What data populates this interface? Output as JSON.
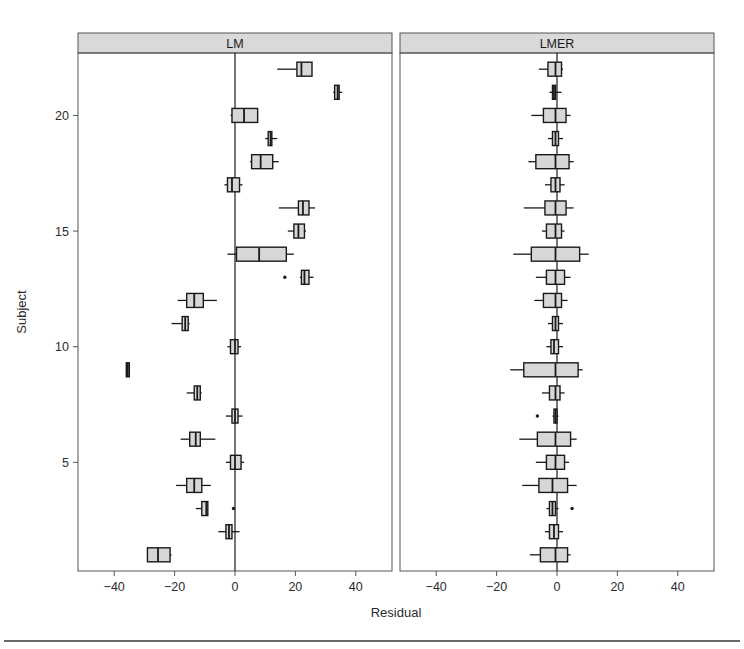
{
  "figure": {
    "background": "#ffffff",
    "frame_color": "#555555",
    "strip_fill": "#d9d9d9",
    "box_fill": "#d7d7d7",
    "line_color": "#1a1a1a",
    "footer_rule_color": "#3a3a3a"
  },
  "chart_data": {
    "type": "box",
    "title": "",
    "xlabel": "Residual",
    "ylabel": "Subject",
    "xlim": [
      -52,
      52
    ],
    "ylim": [
      0.3,
      22.7
    ],
    "xticks": [
      -40,
      -20,
      0,
      20,
      40
    ],
    "xtick_labels": [
      "-40",
      "-20",
      "0",
      "20",
      "40"
    ],
    "yticks": [
      5,
      10,
      15,
      20
    ],
    "ytick_labels": [
      "5",
      "10",
      "15",
      "20"
    ],
    "grid": false,
    "legend": "none",
    "reference_line_x": 0,
    "panels": [
      {
        "name": "LM",
        "label": "LM",
        "boxes": [
          {
            "subject": 22,
            "lower_whisker": 14.0,
            "q1": 20.5,
            "median": 22.0,
            "q3": 25.5,
            "upper_whisker": 25.5,
            "outliers": []
          },
          {
            "subject": 21,
            "lower_whisker": 32.5,
            "q1": 33.0,
            "median": 34.0,
            "q3": 34.5,
            "upper_whisker": 35.5,
            "outliers": []
          },
          {
            "subject": 20,
            "lower_whisker": -1.5,
            "q1": -1.0,
            "median": 3.0,
            "q3": 7.5,
            "upper_whisker": 7.5,
            "outliers": []
          },
          {
            "subject": 19,
            "lower_whisker": 10.0,
            "q1": 11.0,
            "median": 11.8,
            "q3": 12.2,
            "upper_whisker": 14.0,
            "outliers": []
          },
          {
            "subject": 18,
            "lower_whisker": 5.0,
            "q1": 5.5,
            "median": 8.5,
            "q3": 12.5,
            "upper_whisker": 14.5,
            "outliers": []
          },
          {
            "subject": 17,
            "lower_whisker": -3.5,
            "q1": -2.5,
            "median": -1.0,
            "q3": 1.5,
            "upper_whisker": 2.5,
            "outliers": []
          },
          {
            "subject": 16,
            "lower_whisker": 14.5,
            "q1": 21.0,
            "median": 22.5,
            "q3": 24.5,
            "upper_whisker": 26.5,
            "outliers": []
          },
          {
            "subject": 15,
            "lower_whisker": 17.5,
            "q1": 19.5,
            "median": 21.0,
            "q3": 23.0,
            "upper_whisker": 23.5,
            "outliers": []
          },
          {
            "subject": 14,
            "lower_whisker": -2.5,
            "q1": 0.5,
            "median": 8.0,
            "q3": 17.0,
            "upper_whisker": 19.5,
            "outliers": []
          },
          {
            "subject": 13,
            "lower_whisker": 21.5,
            "q1": 22.0,
            "median": 23.0,
            "q3": 24.5,
            "upper_whisker": 26.0,
            "outliers": [
              16.5
            ]
          },
          {
            "subject": 12,
            "lower_whisker": -19.0,
            "q1": -16.0,
            "median": -13.5,
            "q3": -10.5,
            "upper_whisker": -6.0,
            "outliers": []
          },
          {
            "subject": 11,
            "lower_whisker": -21.0,
            "q1": -17.5,
            "median": -16.5,
            "q3": -15.5,
            "upper_whisker": -15.0,
            "outliers": []
          },
          {
            "subject": 10,
            "lower_whisker": -2.5,
            "q1": -1.5,
            "median": 0.0,
            "q3": 1.0,
            "upper_whisker": 2.0,
            "outliers": []
          },
          {
            "subject": 9,
            "lower_whisker": -36.0,
            "q1": -36.0,
            "median": -35.5,
            "q3": -35.0,
            "upper_whisker": -35.0,
            "outliers": []
          },
          {
            "subject": 8,
            "lower_whisker": -16.0,
            "q1": -13.5,
            "median": -12.5,
            "q3": -11.5,
            "upper_whisker": -11.0,
            "outliers": []
          },
          {
            "subject": 7,
            "lower_whisker": -3.0,
            "q1": -1.0,
            "median": 0.0,
            "q3": 1.0,
            "upper_whisker": 2.5,
            "outliers": []
          },
          {
            "subject": 6,
            "lower_whisker": -18.0,
            "q1": -15.0,
            "median": -13.0,
            "q3": -11.5,
            "upper_whisker": -6.5,
            "outliers": []
          },
          {
            "subject": 5,
            "lower_whisker": -3.0,
            "q1": -1.5,
            "median": 0.0,
            "q3": 2.0,
            "upper_whisker": 3.0,
            "outliers": []
          },
          {
            "subject": 4,
            "lower_whisker": -19.5,
            "q1": -16.0,
            "median": -13.5,
            "q3": -11.0,
            "upper_whisker": -8.0,
            "outliers": []
          },
          {
            "subject": 3,
            "lower_whisker": -13.0,
            "q1": -11.0,
            "median": -9.5,
            "q3": -9.0,
            "upper_whisker": -9.0,
            "outliers": [
              -0.5
            ]
          },
          {
            "subject": 2,
            "lower_whisker": -5.5,
            "q1": -3.0,
            "median": -2.0,
            "q3": -1.0,
            "upper_whisker": 1.5,
            "outliers": []
          },
          {
            "subject": 1,
            "lower_whisker": -29.0,
            "q1": -29.0,
            "median": -25.5,
            "q3": -21.5,
            "upper_whisker": -21.0,
            "outliers": []
          }
        ]
      },
      {
        "name": "LMER",
        "label": "LMER",
        "boxes": [
          {
            "subject": 22,
            "lower_whisker": -6.0,
            "q1": -3.0,
            "median": -0.5,
            "q3": 1.5,
            "upper_whisker": 2.0,
            "outliers": []
          },
          {
            "subject": 21,
            "lower_whisker": -2.5,
            "q1": -1.5,
            "median": -1.0,
            "q3": -0.5,
            "upper_whisker": 1.5,
            "outliers": []
          },
          {
            "subject": 20,
            "lower_whisker": -8.5,
            "q1": -4.5,
            "median": -0.5,
            "q3": 3.0,
            "upper_whisker": 4.5,
            "outliers": []
          },
          {
            "subject": 19,
            "lower_whisker": -3.0,
            "q1": -1.5,
            "median": -0.5,
            "q3": 0.5,
            "upper_whisker": 2.0,
            "outliers": []
          },
          {
            "subject": 18,
            "lower_whisker": -9.5,
            "q1": -7.0,
            "median": -0.5,
            "q3": 4.0,
            "upper_whisker": 5.5,
            "outliers": []
          },
          {
            "subject": 17,
            "lower_whisker": -4.0,
            "q1": -2.0,
            "median": -0.5,
            "q3": 1.0,
            "upper_whisker": 2.5,
            "outliers": []
          },
          {
            "subject": 16,
            "lower_whisker": -11.0,
            "q1": -4.0,
            "median": -0.5,
            "q3": 3.0,
            "upper_whisker": 5.5,
            "outliers": []
          },
          {
            "subject": 15,
            "lower_whisker": -5.0,
            "q1": -3.5,
            "median": -0.5,
            "q3": 1.5,
            "upper_whisker": 2.5,
            "outliers": []
          },
          {
            "subject": 14,
            "lower_whisker": -14.5,
            "q1": -8.5,
            "median": -0.5,
            "q3": 7.5,
            "upper_whisker": 10.5,
            "outliers": []
          },
          {
            "subject": 13,
            "lower_whisker": -7.0,
            "q1": -3.5,
            "median": -0.5,
            "q3": 2.5,
            "upper_whisker": 4.5,
            "outliers": []
          },
          {
            "subject": 12,
            "lower_whisker": -7.5,
            "q1": -4.5,
            "median": -0.5,
            "q3": 1.5,
            "upper_whisker": 3.5,
            "outliers": []
          },
          {
            "subject": 11,
            "lower_whisker": -3.0,
            "q1": -1.5,
            "median": -0.5,
            "q3": 0.5,
            "upper_whisker": 2.0,
            "outliers": []
          },
          {
            "subject": 10,
            "lower_whisker": -3.5,
            "q1": -2.0,
            "median": -1.0,
            "q3": 0.5,
            "upper_whisker": 2.0,
            "outliers": []
          },
          {
            "subject": 9,
            "lower_whisker": -15.5,
            "q1": -11.0,
            "median": -0.5,
            "q3": 7.0,
            "upper_whisker": 8.5,
            "outliers": []
          },
          {
            "subject": 8,
            "lower_whisker": -5.0,
            "q1": -2.5,
            "median": -0.5,
            "q3": 1.0,
            "upper_whisker": 2.5,
            "outliers": []
          },
          {
            "subject": 7,
            "lower_whisker": -1.5,
            "q1": -1.0,
            "median": -0.5,
            "q3": 0.0,
            "upper_whisker": 0.5,
            "outliers": [
              -6.5
            ]
          },
          {
            "subject": 6,
            "lower_whisker": -12.5,
            "q1": -6.5,
            "median": -0.5,
            "q3": 4.5,
            "upper_whisker": 6.5,
            "outliers": []
          },
          {
            "subject": 5,
            "lower_whisker": -7.0,
            "q1": -3.5,
            "median": -0.5,
            "q3": 2.5,
            "upper_whisker": 4.0,
            "outliers": []
          },
          {
            "subject": 4,
            "lower_whisker": -11.5,
            "q1": -6.0,
            "median": -1.5,
            "q3": 3.5,
            "upper_whisker": 6.5,
            "outliers": []
          },
          {
            "subject": 3,
            "lower_whisker": -3.5,
            "q1": -2.5,
            "median": -1.5,
            "q3": -0.5,
            "upper_whisker": 0.5,
            "outliers": [
              5.0
            ]
          },
          {
            "subject": 2,
            "lower_whisker": -4.0,
            "q1": -2.5,
            "median": -1.0,
            "q3": 0.5,
            "upper_whisker": 2.0,
            "outliers": []
          },
          {
            "subject": 1,
            "lower_whisker": -9.0,
            "q1": -5.5,
            "median": -0.5,
            "q3": 3.5,
            "upper_whisker": 4.5,
            "outliers": []
          }
        ]
      }
    ]
  }
}
